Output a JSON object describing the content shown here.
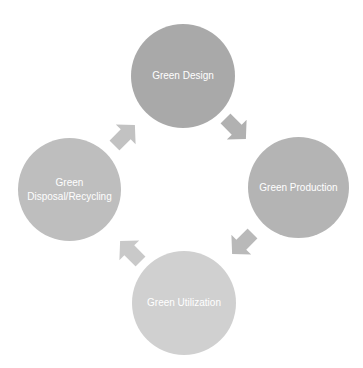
{
  "diagram": {
    "type": "cycle",
    "nodes": [
      {
        "id": "design",
        "label": "Green Design",
        "color": "#a9a9a9"
      },
      {
        "id": "production",
        "label": "Green Production",
        "color": "#b4b4b4"
      },
      {
        "id": "utilization",
        "label": "Green Utilization",
        "color": "#d0d0d0"
      },
      {
        "id": "disposal",
        "label_line1": "Green",
        "label_line2": "Disposal/Recycling",
        "color": "#bebebe"
      }
    ],
    "arrows": [
      {
        "from": "Green Design",
        "to": "Green Production",
        "direction": "down-right",
        "color": "#b1b1b1"
      },
      {
        "from": "Green Production",
        "to": "Green Utilization",
        "direction": "down-left",
        "color": "#b9b9b9"
      },
      {
        "from": "Green Utilization",
        "to": "Green Disposal/Recycling",
        "direction": "up-left",
        "color": "#c9c9c9"
      },
      {
        "from": "Green Disposal/Recycling",
        "to": "Green Design",
        "direction": "up-right",
        "color": "#c2c2c2"
      }
    ]
  }
}
